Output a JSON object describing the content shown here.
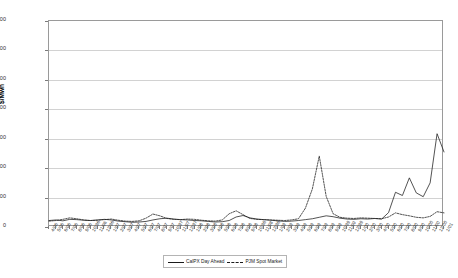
{
  "chart_data": {
    "type": "line",
    "title": "",
    "xlabel": "",
    "ylabel": "$/Mwh",
    "ylim": [
      0,
      700
    ],
    "ytick_values": [
      0,
      100,
      200,
      300,
      400,
      500,
      600,
      700
    ],
    "ytick_labels": [
      "0",
      "100",
      "200",
      "300",
      "400",
      "500",
      "600",
      "700"
    ],
    "grid": true,
    "legend_position": "bottom",
    "categories": [
      "4/96",
      "5/96",
      "6/96",
      "7/96",
      "8/96",
      "9/96",
      "10/96",
      "11/96",
      "12/96",
      "1/97",
      "2/97",
      "3/97",
      "4/97",
      "5/97",
      "6/97",
      "7/97",
      "8/97",
      "9/97",
      "10/97",
      "11/97",
      "12/97",
      "1/98",
      "2/98",
      "3/98",
      "4/98",
      "5/98",
      "6/98",
      "7/98",
      "8/98",
      "9/98",
      "10/98",
      "11/98",
      "12/98",
      "1/99",
      "2/99",
      "3/99",
      "4/99",
      "5/99",
      "6/99",
      "7/99",
      "8/99",
      "9/99",
      "10/99",
      "11/99",
      "12/99",
      "1/00",
      "2/00",
      "3/00",
      "4/00",
      "5/00",
      "6/00",
      "7/00",
      "8/00",
      "9/00",
      "10/00",
      "11/00",
      "12/00",
      "1/01"
    ],
    "xtick_labels": [
      "4/96",
      "5/96",
      "6/96",
      "7/96",
      "8/96",
      "9/96",
      "10/96",
      "11/96",
      "12/96",
      "1/97",
      "2/97",
      "3/97",
      "4/97",
      "5/97",
      "6/97",
      "7/97",
      "8/97",
      "9/97",
      "10/97",
      "11/97",
      "12/97",
      "1/98",
      "2/98",
      "3/98",
      "4/98",
      "5/98",
      "6/98",
      "7/98",
      "8/98",
      "9/98",
      "10/98",
      "11/98",
      "12/98",
      "1/99",
      "2/99",
      "3/99",
      "4/99",
      "5/99",
      "6/99",
      "7/99",
      "8/99",
      "9/99",
      "10/99",
      "11/99",
      "12/99",
      "1/00",
      "2/00",
      "3/00",
      "4/00",
      "5/00",
      "6/00",
      "7/00",
      "8/00",
      "9/00",
      "10/00",
      "11/00",
      "12/00",
      "1/01"
    ],
    "series": [
      {
        "name": "CalPX Day Ahead",
        "style": "solid",
        "color": "#1a1a1a",
        "values": [
          22,
          24,
          21,
          26,
          25,
          23,
          22,
          24,
          26,
          24,
          20,
          18,
          16,
          17,
          19,
          24,
          28,
          30,
          27,
          25,
          24,
          22,
          21,
          19,
          17,
          18,
          22,
          34,
          39,
          31,
          27,
          25,
          23,
          21,
          19,
          20,
          22,
          25,
          28,
          33,
          38,
          35,
          30,
          27,
          26,
          28,
          27,
          29,
          27,
          49,
          118,
          107,
          167,
          116,
          103,
          150,
          317,
          255
        ]
      },
      {
        "name": "PJM Spot Market",
        "style": "dashed",
        "color": "#1a1a1a",
        "values": [
          20,
          22,
          26,
          31,
          28,
          24,
          22,
          23,
          25,
          27,
          23,
          20,
          19,
          21,
          30,
          44,
          38,
          29,
          26,
          25,
          27,
          26,
          23,
          21,
          20,
          24,
          45,
          55,
          42,
          29,
          26,
          25,
          24,
          23,
          22,
          24,
          28,
          64,
          129,
          241,
          104,
          45,
          33,
          30,
          29,
          31,
          30,
          29,
          28,
          34,
          48,
          42,
          38,
          33,
          31,
          36,
          52,
          48
        ]
      }
    ]
  },
  "legend": {
    "entries": [
      {
        "label": "CalPX Day Ahead",
        "style": "solid"
      },
      {
        "label": "PJM Spot Market",
        "style": "dashed"
      }
    ]
  }
}
